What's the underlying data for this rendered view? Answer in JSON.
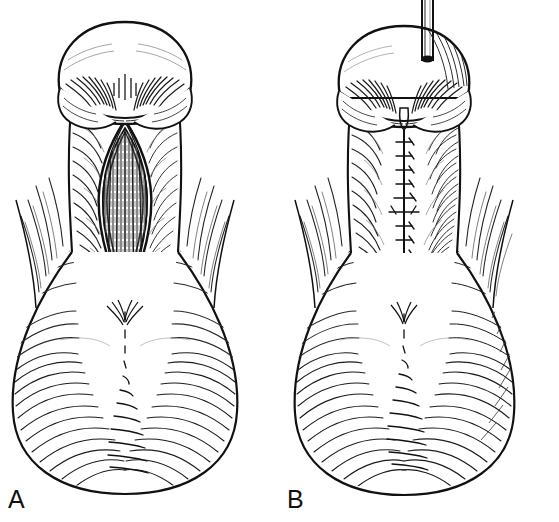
{
  "figure": {
    "style": "pen-and-ink hatched medical drawing",
    "background_color": "#ffffff",
    "ink_color": "#111111",
    "panel_count": 2
  },
  "panels": [
    {
      "id": "A",
      "label": "A",
      "label_x": 8,
      "label_y": 508,
      "caption": "",
      "stage": "open lens-shaped ventral incision",
      "features": [
        "glans with rounded dome",
        "coronal sulcus with radial hatching",
        "open lens (diamond) shaped incision on shaft",
        "exposed longitudinally striated tissue inside incision",
        "scrotal base with dense curved hatching",
        "median raphe line"
      ]
    },
    {
      "id": "B",
      "label": "B",
      "label_x": 287,
      "label_y": 508,
      "caption": "",
      "stage": "closed incision with interrupted sutures and indwelling catheter",
      "features": [
        "catheter tube entering meatus at apex",
        "glans with rounded dome",
        "coronal sulcus with radial hatching",
        "vertical midline suture line with interrupted stitch marks",
        "neo-meatus slit at distal end of suture line",
        "scrotal base with dense curved hatching",
        "median raphe line"
      ],
      "suture_count": 11
    }
  ],
  "labels": {
    "panel_a": "A",
    "panel_b": "B"
  },
  "colors": {
    "ink": "#111111",
    "ink_soft": "#333333",
    "ink_light": "#555555",
    "background": "#ffffff"
  }
}
